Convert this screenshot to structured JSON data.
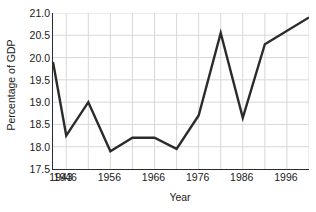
{
  "chart_data": {
    "type": "line",
    "title": "",
    "xlabel": "Year",
    "ylabel": "Percentage of GDP",
    "xlim": [
      1943,
      2001
    ],
    "ylim": [
      17.5,
      21.0
    ],
    "grid": true,
    "legend": "none",
    "line_color": "#2b2b2b",
    "grid_color": "#d8d8d8",
    "axis_color": "#2b2b2b",
    "y_ticks": [
      "21.0",
      "20.5",
      "20.0",
      "19.5",
      "19.0",
      "18.5",
      "18.0",
      "17.5"
    ],
    "y_tick_values": [
      21.0,
      20.5,
      20.0,
      19.5,
      19.0,
      18.5,
      18.0,
      17.5
    ],
    "x_ticks": [
      "1943",
      "1946",
      "1956",
      "1966",
      "1976",
      "1986",
      "1996"
    ],
    "x_tick_values": [
      1943,
      1946,
      1956,
      1966,
      1976,
      1986,
      1996
    ],
    "x_gridline_values": [
      1946,
      1951,
      1956,
      1961,
      1966,
      1971,
      1976,
      1981,
      1986,
      1991,
      1996,
      2001
    ],
    "x": [
      1943,
      1946,
      1951,
      1956,
      1961,
      1966,
      1971,
      1976,
      1981,
      1986,
      1991,
      2001
    ],
    "values": [
      19.9,
      18.25,
      19.0,
      17.9,
      18.2,
      18.2,
      17.95,
      18.7,
      20.55,
      18.65,
      20.3,
      20.9
    ],
    "series": [
      {
        "name": "Percentage of GDP",
        "x": [
          1943,
          1946,
          1951,
          1956,
          1961,
          1966,
          1971,
          1976,
          1981,
          1986,
          1991,
          2001
        ],
        "values": [
          19.9,
          18.25,
          19.0,
          17.9,
          18.2,
          18.2,
          17.95,
          18.7,
          20.55,
          18.65,
          20.3,
          20.9
        ]
      }
    ]
  }
}
